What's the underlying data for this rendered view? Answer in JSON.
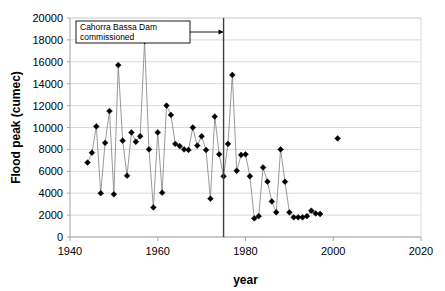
{
  "chart_data": {
    "type": "line",
    "title": "",
    "xlabel": "year",
    "ylabel": "Flood peak (cumec)",
    "xlim": [
      1940,
      2020
    ],
    "ylim": [
      0,
      20000
    ],
    "xticks": [
      1940,
      1960,
      1980,
      2000,
      2020
    ],
    "yticks": [
      0,
      2000,
      4000,
      6000,
      8000,
      10000,
      12000,
      14000,
      16000,
      18000,
      20000
    ],
    "grid": "horizontal",
    "legend": "none",
    "marker": "diamond",
    "series": [
      {
        "name": "Flood peak",
        "connected": true,
        "x": [
          1944,
          1945,
          1946,
          1947,
          1948,
          1949,
          1950,
          1951,
          1952,
          1953,
          1954,
          1955,
          1956,
          1957,
          1958,
          1959,
          1960,
          1961,
          1962,
          1963,
          1964,
          1965,
          1966,
          1967,
          1968,
          1969,
          1970,
          1971,
          1972,
          1973,
          1974,
          1975,
          1976,
          1977,
          1978,
          1979,
          1980,
          1981,
          1982,
          1983,
          1984,
          1985,
          1986,
          1987,
          1988,
          1989,
          1990,
          1991,
          1992,
          1993,
          1994,
          1995,
          1996,
          1997
        ],
        "y": [
          6800,
          7700,
          10100,
          4000,
          8600,
          11500,
          3900,
          15700,
          8800,
          5600,
          9550,
          8700,
          9200,
          17900,
          8000,
          2700,
          9550,
          4050,
          12000,
          11150,
          8500,
          8300,
          8000,
          7950,
          10000,
          8350,
          9200,
          7950,
          3500,
          11000,
          7550,
          5550,
          8500,
          14800,
          6050,
          7500,
          7550,
          5550,
          1700,
          1900,
          6350,
          5050,
          3250,
          2250,
          8000,
          5050,
          2250,
          1800,
          1800,
          1800,
          1900,
          2400,
          2150,
          2100
        ]
      },
      {
        "name": "Flood peak (isolated)",
        "connected": false,
        "x": [
          2001
        ],
        "y": [
          9000
        ]
      }
    ],
    "annotations": [
      {
        "id": "dam-annotation",
        "text_line1": "Cahorra Bassa Dam",
        "text_line2": "commissioned",
        "points_to_year": 1975,
        "type": "boxed-label-with-arrow"
      }
    ],
    "reference_lines": [
      {
        "id": "dam-commissioned-line",
        "orientation": "vertical",
        "x": 1975
      }
    ],
    "colors": {
      "marker": "#000000",
      "line": "#808080",
      "grid": "#d9d9d9",
      "axis": "#a6a6a6",
      "reference_line": "#404040",
      "background": "#ffffff"
    }
  }
}
